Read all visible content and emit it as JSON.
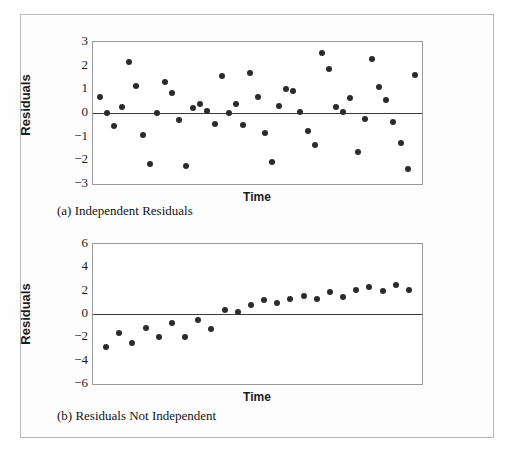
{
  "figure": {
    "background_color": "#fdfdfd",
    "border_color": "#b9b9b9",
    "point_color": "#2b2b2b",
    "axis_color": "#999999",
    "zero_line_color": "#3a3a3a"
  },
  "panel_a": {
    "caption": "(a) Independent Residuals",
    "ylabel": "Residuals",
    "xlabel": "Time"
  },
  "panel_b": {
    "caption": "(b) Residuals Not Independent",
    "ylabel": "Residuals",
    "xlabel": "Time"
  },
  "chart_data": [
    {
      "type": "scatter",
      "title": "(a) Independent Residuals",
      "xlabel": "Time",
      "ylabel": "Residuals",
      "ylim": [
        -3,
        3
      ],
      "yticks": [
        3,
        2,
        1,
        0,
        -1,
        -2,
        -3
      ],
      "ytick_labels": [
        "3",
        "2",
        "1",
        "0",
        "−1",
        "−2",
        "−3"
      ],
      "xlim": [
        0,
        46
      ],
      "xticks": [],
      "grid": false,
      "legend": null,
      "reference_line": 0,
      "x": [
        1,
        2,
        3,
        4,
        5,
        6,
        7,
        8,
        9,
        10,
        11,
        12,
        13,
        14,
        15,
        16,
        17,
        18,
        19,
        20,
        21,
        22,
        23,
        24,
        25,
        26,
        27,
        28,
        29,
        30,
        31,
        32,
        33,
        34,
        35,
        36,
        37,
        38,
        39,
        40,
        41,
        42,
        43,
        44,
        45
      ],
      "y": [
        0.68,
        0.02,
        -0.55,
        0.25,
        2.15,
        1.15,
        -0.92,
        -2.17,
        0.0,
        1.3,
        0.85,
        -0.3,
        -2.25,
        0.22,
        0.4,
        0.1,
        -0.47,
        1.55,
        0.02,
        0.38,
        -0.5,
        1.7,
        0.68,
        -0.85,
        -2.05,
        0.3,
        1.0,
        0.95,
        0.05,
        -0.75,
        -1.35,
        2.55,
        1.85,
        0.25,
        0.05,
        0.65,
        -1.65,
        -0.25,
        2.3,
        1.1,
        0.55,
        -0.4,
        -1.25,
        -2.35,
        1.6
      ],
      "values": [
        0.68,
        0.02,
        -0.55,
        0.25,
        2.15,
        1.15,
        -0.92,
        -2.17,
        0.0,
        1.3,
        0.85,
        -0.3,
        -2.25,
        0.22,
        0.4,
        0.1,
        -0.47,
        1.55,
        0.02,
        0.38,
        -0.5,
        1.7,
        0.68,
        -0.85,
        -2.05,
        0.3,
        1.0,
        0.95,
        0.05,
        -0.75,
        -1.35,
        2.55,
        1.85,
        0.25,
        0.05,
        0.65,
        -1.65,
        -0.25,
        2.3,
        1.1,
        0.55,
        -0.4,
        -1.25,
        -2.35,
        1.6
      ]
    },
    {
      "type": "scatter",
      "title": "(b) Residuals Not Independent",
      "xlabel": "Time",
      "ylabel": "Residuals",
      "ylim": [
        -6,
        6
      ],
      "yticks": [
        6,
        4,
        2,
        0,
        -2,
        -4,
        -6
      ],
      "ytick_labels": [
        "6",
        "4",
        "2",
        "0",
        "−2",
        "−4",
        "−6"
      ],
      "xlim": [
        0,
        25
      ],
      "xticks": [],
      "grid": false,
      "legend": null,
      "reference_line": 0,
      "x": [
        1,
        2,
        3,
        4,
        5,
        6,
        7,
        8,
        9,
        10,
        11,
        12,
        13,
        14,
        15,
        16,
        17,
        18,
        19,
        20,
        21,
        22,
        23,
        24
      ],
      "y": [
        -2.8,
        -1.6,
        -2.5,
        -1.2,
        -1.95,
        -0.75,
        -2.0,
        -0.5,
        -1.3,
        0.35,
        0.15,
        0.8,
        1.2,
        0.95,
        1.3,
        1.55,
        1.25,
        1.85,
        1.5,
        2.1,
        2.3,
        1.95,
        2.45,
        2.05
      ],
      "values": [
        -2.8,
        -1.6,
        -2.5,
        -1.2,
        -1.95,
        -0.75,
        -2.0,
        -0.5,
        -1.3,
        0.35,
        0.15,
        0.8,
        1.2,
        0.95,
        1.3,
        1.55,
        1.25,
        1.85,
        1.5,
        2.1,
        2.3,
        1.95,
        2.45,
        2.05
      ]
    }
  ]
}
